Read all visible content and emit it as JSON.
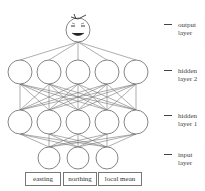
{
  "diagram": {
    "type": "neural-network",
    "colors": {
      "stroke": "#666666",
      "background": "#ffffff",
      "text": "#444444"
    },
    "layers": [
      {
        "id": "output",
        "label_line1": "output",
        "label_line2": "layer",
        "node_count": 1,
        "node_icon": "smiley-face-icon"
      },
      {
        "id": "hidden2",
        "label_line1": "hidden",
        "label_line2": "layer 2",
        "node_count": 5
      },
      {
        "id": "hidden1",
        "label_line1": "hidden",
        "label_line2": "layer 1",
        "node_count": 5
      },
      {
        "id": "input",
        "label_line1": "input",
        "label_line2": "layer",
        "node_count": 3
      }
    ],
    "inputs": [
      {
        "label": "easting"
      },
      {
        "label": "northing"
      },
      {
        "label": "local mean"
      }
    ]
  }
}
